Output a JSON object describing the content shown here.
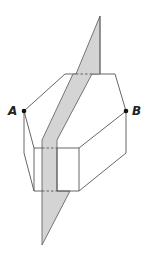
{
  "diagram": {
    "type": "geometry",
    "labels": {
      "point_a": "A",
      "point_b": "B"
    },
    "colors": {
      "line": "#555555",
      "plane_fill": "#d4d4d4",
      "plane_stroke": "#666666",
      "point": "#111111"
    }
  }
}
